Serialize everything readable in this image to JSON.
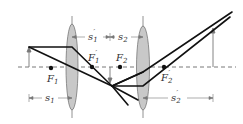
{
  "diagram": {
    "type": "two-lens optical system ray diagram",
    "labels": {
      "F1": "F",
      "F1_sub": "1",
      "F1p": "F",
      "F1p_sub": "1",
      "F2": "F",
      "F2_sub": "2",
      "F2p": "F",
      "F2p_sub": "2",
      "prime": "′",
      "s1": "s",
      "s1_sub": "1",
      "s1p": "s",
      "s1p_sub": "1",
      "s2": "s",
      "s2_sub": "2",
      "s2p": "s",
      "s2p_sub": "2"
    },
    "colors": {
      "lens_fill": "#c8c8c8",
      "lens_stroke": "#777777",
      "ray": "#111111",
      "axis": "#555555",
      "arrow": "#777777"
    }
  }
}
